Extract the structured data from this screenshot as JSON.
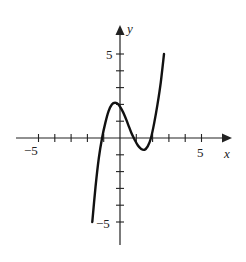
{
  "chart_data": {
    "type": "line",
    "title": "",
    "xlabel": "x",
    "ylabel": "y",
    "xlim": [
      -6,
      6.5
    ],
    "ylim": [
      -6.3,
      6.5
    ],
    "grid": false,
    "x_ticks": [
      -5,
      -4,
      -3,
      -2,
      -1,
      1,
      2,
      3,
      4,
      5
    ],
    "y_ticks": [
      -5,
      -4,
      -3,
      -2,
      -1,
      1,
      2,
      3,
      4,
      5
    ],
    "x_tick_labels": [
      {
        "value": -5,
        "label": "−5"
      },
      {
        "value": 5,
        "label": "5"
      }
    ],
    "y_tick_labels": [
      {
        "value": 5,
        "label": "5"
      },
      {
        "value": -5,
        "label": "−5"
      }
    ],
    "series": [
      {
        "name": "f(x)",
        "description": "cubic curve with local max near (-0.3, 2) and local min near (1.5, -0.7); roots near x=-1.1, 1, 1.8",
        "x": [
          -1.7,
          -1.5,
          -1.3,
          -1.1,
          -0.9,
          -0.7,
          -0.5,
          -0.3,
          -0.1,
          0.1,
          0.3,
          0.5,
          0.7,
          0.9,
          1.1,
          1.3,
          1.5,
          1.7,
          1.9,
          2.1,
          2.3,
          2.5,
          2.7
        ],
        "y": [
          -5.0,
          -2.9,
          -1.2,
          0.0,
          0.9,
          1.6,
          2.0,
          2.1,
          2.0,
          1.7,
          1.3,
          0.8,
          0.3,
          -0.1,
          -0.45,
          -0.65,
          -0.7,
          -0.5,
          0.0,
          0.9,
          2.0,
          3.3,
          5.0
        ]
      }
    ]
  },
  "labels": {
    "x_axis": "x",
    "y_axis": "y",
    "x_neg5": "−5",
    "x_pos5": "5",
    "y_pos5": "5",
    "y_neg5": "−5"
  }
}
